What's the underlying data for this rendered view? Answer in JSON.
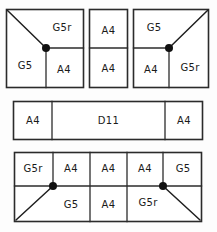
{
  "diagram": {
    "colors": {
      "line": "#2b2b2b",
      "node": "#111111",
      "background": "#fdfdfd",
      "text": "#1a1a1a"
    },
    "bands": [
      {
        "name": "top-band",
        "panels": [
          {
            "name": "top-left-panel",
            "node": true,
            "brace": "top-left-corner-to-node",
            "cells": [
              {
                "id": "tl-g5r",
                "label": "G5r"
              },
              {
                "id": "tl-g5",
                "label": "G5"
              },
              {
                "id": "tl-a4",
                "label": "A4"
              }
            ]
          },
          {
            "name": "top-middle-panel",
            "node": false,
            "brace": null,
            "cells": [
              {
                "id": "tm-a4-upper",
                "label": "A4"
              },
              {
                "id": "tm-a4-lower",
                "label": "A4"
              }
            ]
          },
          {
            "name": "top-right-panel",
            "node": true,
            "brace": "top-right-corner-to-node",
            "cells": [
              {
                "id": "tr-g5",
                "label": "G5"
              },
              {
                "id": "tr-a4",
                "label": "A4"
              },
              {
                "id": "tr-g5r",
                "label": "G5r"
              }
            ]
          }
        ]
      },
      {
        "name": "middle-band",
        "panels": [
          {
            "name": "middle-panel",
            "node": false,
            "brace": null,
            "cells": [
              {
                "id": "mid-a4-left",
                "label": "A4"
              },
              {
                "id": "mid-d11",
                "label": "D11"
              },
              {
                "id": "mid-a4-right",
                "label": "A4"
              }
            ]
          }
        ]
      },
      {
        "name": "bottom-band",
        "panels": [
          {
            "name": "bottom-panel",
            "node": true,
            "brace": "node-to-bottom-corners",
            "cells": [
              {
                "id": "bt-g5r",
                "label": "G5r"
              },
              {
                "id": "bt-a4-1",
                "label": "A4"
              },
              {
                "id": "bt-a4-2",
                "label": "A4"
              },
              {
                "id": "bt-a4-3",
                "label": "A4"
              },
              {
                "id": "bt-g5",
                "label": "G5"
              },
              {
                "id": "bb-g5",
                "label": "G5"
              },
              {
                "id": "bb-a4",
                "label": "A4"
              },
              {
                "id": "bb-g5r",
                "label": "G5r"
              }
            ]
          }
        ]
      }
    ]
  }
}
